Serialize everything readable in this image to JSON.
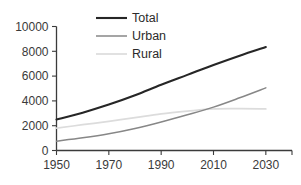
{
  "chart_data": {
    "type": "line",
    "title": "",
    "xlabel": "",
    "ylabel": "",
    "x": [
      1950,
      1960,
      1970,
      1980,
      1990,
      2000,
      2010,
      2020,
      2030
    ],
    "xlim": [
      1950,
      2040
    ],
    "ylim": [
      0,
      10000
    ],
    "xticks": [
      "1950",
      "1970",
      "1990",
      "2010",
      "2030"
    ],
    "xtick_values": [
      1950,
      1970,
      1990,
      2010,
      2030
    ],
    "yticks": [
      "0",
      "2000",
      "4000",
      "6000",
      "8000",
      "10000"
    ],
    "ytick_values": [
      0,
      2000,
      4000,
      6000,
      8000,
      10000
    ],
    "grid": false,
    "legend_position": "top-center",
    "series": [
      {
        "name": "Total",
        "color": "#262626",
        "width": 2.1,
        "values": [
          2500,
          3050,
          3700,
          4450,
          5300,
          6100,
          6900,
          7650,
          8350
        ]
      },
      {
        "name": "Urban",
        "color": "#878787",
        "width": 1.5,
        "values": [
          750,
          1020,
          1350,
          1780,
          2300,
          2880,
          3500,
          4250,
          5050
        ]
      },
      {
        "name": "Rural",
        "color": "#dcdcdc",
        "width": 1.7,
        "values": [
          1800,
          2080,
          2350,
          2650,
          2950,
          3170,
          3350,
          3370,
          3350
        ]
      }
    ]
  },
  "axes": {
    "y_axis_name": "y-axis",
    "x_axis_name": "x-axis"
  }
}
